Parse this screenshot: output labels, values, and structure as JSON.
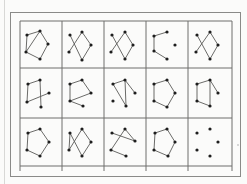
{
  "figure": {
    "rows": 3,
    "cols": 5,
    "grid": {
      "left": 20,
      "top": 21,
      "right": 232,
      "bottom": 166,
      "col_lines": [
        20,
        62,
        104,
        146,
        188,
        232
      ],
      "row_lines": [
        21,
        68,
        118,
        166
      ],
      "tick_extend_to": 171
    },
    "colors": {
      "line": "#6e6e6c",
      "vertex": "#1e1e1e",
      "edge": "#5a5a58",
      "frame": "#8a8a88"
    },
    "cells": [
      {
        "row": 0,
        "col": 0,
        "vertices": [
          [
            27,
            35
          ],
          [
            40,
            31
          ],
          [
            48,
            44
          ],
          [
            26,
            52
          ],
          [
            40,
            59
          ]
        ],
        "edges": [
          [
            0,
            1
          ],
          [
            1,
            2
          ],
          [
            2,
            4
          ],
          [
            4,
            3
          ],
          [
            3,
            0
          ],
          [
            3,
            1
          ]
        ]
      },
      {
        "row": 0,
        "col": 1,
        "vertices": [
          [
            70,
            35
          ],
          [
            82,
            32
          ],
          [
            91,
            45
          ],
          [
            69,
            52
          ],
          [
            82,
            60
          ]
        ],
        "edges": [
          [
            0,
            4
          ],
          [
            1,
            3
          ],
          [
            1,
            2
          ],
          [
            2,
            4
          ]
        ]
      },
      {
        "row": 0,
        "col": 2,
        "vertices": [
          [
            112,
            35
          ],
          [
            125,
            32
          ],
          [
            133,
            45
          ],
          [
            111,
            52
          ],
          [
            125,
            59
          ]
        ],
        "edges": [
          [
            0,
            4
          ],
          [
            1,
            3
          ],
          [
            1,
            2
          ],
          [
            2,
            4
          ]
        ]
      },
      {
        "row": 0,
        "col": 3,
        "vertices": [
          [
            154,
            36
          ],
          [
            167,
            32
          ],
          [
            175,
            45
          ],
          [
            154,
            51
          ],
          [
            167,
            59
          ]
        ],
        "edges": [
          [
            0,
            1
          ],
          [
            0,
            3
          ],
          [
            3,
            4
          ]
        ]
      },
      {
        "row": 0,
        "col": 4,
        "vertices": [
          [
            197,
            35
          ],
          [
            210,
            32
          ],
          [
            218,
            45
          ],
          [
            196,
            52
          ],
          [
            210,
            59
          ]
        ],
        "edges": [
          [
            0,
            4
          ],
          [
            1,
            3
          ],
          [
            1,
            2
          ],
          [
            2,
            4
          ]
        ]
      },
      {
        "row": 1,
        "col": 0,
        "vertices": [
          [
            28,
            84
          ],
          [
            40,
            80
          ],
          [
            49,
            93
          ],
          [
            27,
            102
          ],
          [
            41,
            107
          ]
        ],
        "edges": [
          [
            0,
            1
          ],
          [
            0,
            3
          ],
          [
            1,
            4
          ],
          [
            3,
            2
          ]
        ]
      },
      {
        "row": 1,
        "col": 1,
        "vertices": [
          [
            70,
            84
          ],
          [
            82,
            80
          ],
          [
            91,
            93
          ],
          [
            70,
            101
          ],
          [
            83,
            106
          ]
        ],
        "edges": [
          [
            0,
            1
          ],
          [
            0,
            3
          ],
          [
            1,
            2
          ],
          [
            3,
            4
          ],
          [
            2,
            3
          ]
        ]
      },
      {
        "row": 1,
        "col": 2,
        "vertices": [
          [
            113,
            84
          ],
          [
            125,
            80
          ],
          [
            135,
            93
          ],
          [
            113,
            101
          ],
          [
            126,
            106
          ]
        ],
        "edges": [
          [
            0,
            1
          ],
          [
            0,
            4
          ],
          [
            1,
            2
          ],
          [
            1,
            4
          ]
        ]
      },
      {
        "row": 1,
        "col": 3,
        "vertices": [
          [
            154,
            84
          ],
          [
            167,
            80
          ],
          [
            175,
            93
          ],
          [
            154,
            101
          ],
          [
            167,
            107
          ]
        ],
        "edges": [
          [
            0,
            1
          ],
          [
            1,
            2
          ],
          [
            2,
            4
          ],
          [
            4,
            3
          ],
          [
            3,
            0
          ]
        ]
      },
      {
        "row": 1,
        "col": 4,
        "vertices": [
          [
            197,
            84
          ],
          [
            210,
            80
          ],
          [
            218,
            93
          ],
          [
            197,
            101
          ],
          [
            210,
            106
          ]
        ],
        "edges": [
          [
            0,
            1
          ],
          [
            0,
            3
          ],
          [
            3,
            4
          ],
          [
            1,
            4
          ],
          [
            1,
            2
          ]
        ]
      },
      {
        "row": 2,
        "col": 0,
        "vertices": [
          [
            28,
            133
          ],
          [
            40,
            129
          ],
          [
            49,
            142
          ],
          [
            27,
            150
          ],
          [
            40,
            156
          ]
        ],
        "edges": [
          [
            0,
            1
          ],
          [
            1,
            2
          ],
          [
            2,
            4
          ],
          [
            4,
            3
          ],
          [
            3,
            0
          ]
        ]
      },
      {
        "row": 2,
        "col": 1,
        "vertices": [
          [
            70,
            133
          ],
          [
            82,
            129
          ],
          [
            91,
            142
          ],
          [
            69,
            150
          ],
          [
            82,
            156
          ]
        ],
        "edges": [
          [
            0,
            4
          ],
          [
            1,
            3
          ],
          [
            1,
            2
          ],
          [
            2,
            4
          ],
          [
            0,
            3
          ]
        ]
      },
      {
        "row": 2,
        "col": 2,
        "vertices": [
          [
            112,
            133
          ],
          [
            125,
            129
          ],
          [
            135,
            141
          ],
          [
            111,
            150
          ],
          [
            126,
            156
          ]
        ],
        "edges": [
          [
            0,
            2
          ],
          [
            1,
            3
          ],
          [
            3,
            4
          ],
          [
            1,
            2
          ]
        ]
      },
      {
        "row": 2,
        "col": 3,
        "vertices": [
          [
            155,
            133
          ],
          [
            167,
            129
          ],
          [
            175,
            142
          ],
          [
            154,
            150
          ],
          [
            168,
            156
          ]
        ],
        "edges": [
          [
            0,
            1
          ],
          [
            1,
            2
          ],
          [
            2,
            4
          ],
          [
            4,
            3
          ],
          [
            3,
            0
          ]
        ]
      },
      {
        "row": 2,
        "col": 4,
        "vertices": [
          [
            197,
            133
          ],
          [
            210,
            129
          ],
          [
            218,
            142
          ],
          [
            197,
            150
          ],
          [
            210,
            156
          ]
        ],
        "edges": []
      }
    ],
    "stray_marks": [
      [
        238,
        145
      ]
    ]
  }
}
